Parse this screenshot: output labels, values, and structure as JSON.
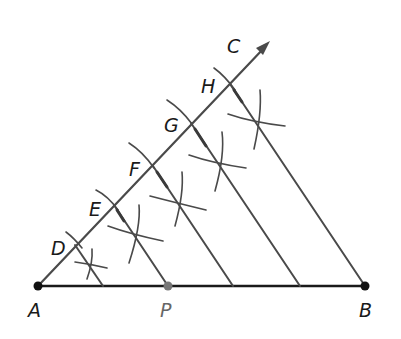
{
  "diagram": {
    "points": [
      {
        "label": "A",
        "x": 38,
        "y": 286,
        "lx": 28,
        "ly": 300
      },
      {
        "label": "B",
        "x": 365,
        "y": 286,
        "lx": 359,
        "ly": 300
      },
      {
        "label": "P",
        "x": 168,
        "y": 286,
        "lx": 160,
        "ly": 300
      },
      {
        "label": "C",
        "x": 268,
        "y": 43,
        "lx": 226,
        "ly": 36
      },
      {
        "label": "D",
        "x": 75,
        "y": 245,
        "lx": 51,
        "ly": 238
      },
      {
        "label": "E",
        "x": 114,
        "y": 205,
        "lx": 90,
        "ly": 199
      },
      {
        "label": "F",
        "x": 153,
        "y": 166,
        "lx": 129,
        "ly": 160
      },
      {
        "label": "G",
        "x": 191,
        "y": 123,
        "lx": 164,
        "ly": 117
      },
      {
        "label": "H",
        "x": 230,
        "y": 84,
        "lx": 201,
        "ly": 77
      }
    ],
    "colors": {
      "line": "#4a4a4a",
      "segment": "#1a1a1a",
      "point_p": "#777777"
    }
  }
}
